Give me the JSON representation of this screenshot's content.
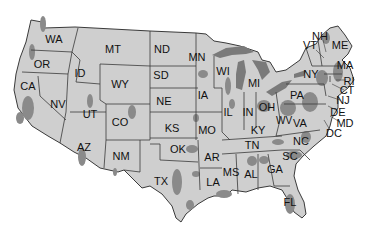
{
  "map": {
    "title": "",
    "colors": {
      "land": "#cfcfcf",
      "shaded": "#8a8a8a",
      "lakes": "#7a7a7a",
      "border": "#3a3a3a",
      "background": "#ffffff"
    },
    "states": [
      {
        "abbr": "WA",
        "x": 54,
        "y": 39
      },
      {
        "abbr": "OR",
        "x": 42,
        "y": 64
      },
      {
        "abbr": "CA",
        "x": 28,
        "y": 86
      },
      {
        "abbr": "NV",
        "x": 58,
        "y": 104
      },
      {
        "abbr": "ID",
        "x": 80,
        "y": 73
      },
      {
        "abbr": "MT",
        "x": 113,
        "y": 49
      },
      {
        "abbr": "WY",
        "x": 120,
        "y": 84
      },
      {
        "abbr": "UT",
        "x": 90,
        "y": 114
      },
      {
        "abbr": "CO",
        "x": 120,
        "y": 122
      },
      {
        "abbr": "AZ",
        "x": 84,
        "y": 147
      },
      {
        "abbr": "NM",
        "x": 121,
        "y": 156
      },
      {
        "abbr": "ND",
        "x": 162,
        "y": 49
      },
      {
        "abbr": "SD",
        "x": 161,
        "y": 75
      },
      {
        "abbr": "NE",
        "x": 164,
        "y": 101
      },
      {
        "abbr": "KS",
        "x": 172,
        "y": 128
      },
      {
        "abbr": "OK",
        "x": 178,
        "y": 149
      },
      {
        "abbr": "TX",
        "x": 161,
        "y": 181
      },
      {
        "abbr": "MN",
        "x": 197,
        "y": 57
      },
      {
        "abbr": "IA",
        "x": 203,
        "y": 95
      },
      {
        "abbr": "MO",
        "x": 207,
        "y": 130
      },
      {
        "abbr": "AR",
        "x": 212,
        "y": 157
      },
      {
        "abbr": "LA",
        "x": 213,
        "y": 182
      },
      {
        "abbr": "WI",
        "x": 223,
        "y": 71
      },
      {
        "abbr": "IL",
        "x": 228,
        "y": 112
      },
      {
        "abbr": "MI",
        "x": 254,
        "y": 83
      },
      {
        "abbr": "IN",
        "x": 248,
        "y": 112
      },
      {
        "abbr": "OH",
        "x": 267,
        "y": 107
      },
      {
        "abbr": "KY",
        "x": 258,
        "y": 130
      },
      {
        "abbr": "TN",
        "x": 252,
        "y": 145
      },
      {
        "abbr": "MS",
        "x": 231,
        "y": 172
      },
      {
        "abbr": "AL",
        "x": 251,
        "y": 174
      },
      {
        "abbr": "GA",
        "x": 275,
        "y": 169
      },
      {
        "abbr": "FL",
        "x": 290,
        "y": 202
      },
      {
        "abbr": "SC",
        "x": 290,
        "y": 156
      },
      {
        "abbr": "NC",
        "x": 301,
        "y": 141
      },
      {
        "abbr": "VA",
        "x": 300,
        "y": 123
      },
      {
        "abbr": "WV",
        "x": 284,
        "y": 121
      },
      {
        "abbr": "PA",
        "x": 297,
        "y": 95
      },
      {
        "abbr": "NY",
        "x": 311,
        "y": 74
      },
      {
        "abbr": "VT",
        "x": 310,
        "y": 45
      },
      {
        "abbr": "NH",
        "x": 320,
        "y": 36
      },
      {
        "abbr": "ME",
        "x": 340,
        "y": 45
      },
      {
        "abbr": "MA",
        "x": 345,
        "y": 65
      },
      {
        "abbr": "RI",
        "x": 349,
        "y": 81
      },
      {
        "abbr": "CT",
        "x": 347,
        "y": 90
      },
      {
        "abbr": "NJ",
        "x": 343,
        "y": 100
      },
      {
        "abbr": "DE",
        "x": 338,
        "y": 112
      },
      {
        "abbr": "MD",
        "x": 345,
        "y": 123
      },
      {
        "abbr": "DC",
        "x": 334,
        "y": 133
      }
    ]
  }
}
